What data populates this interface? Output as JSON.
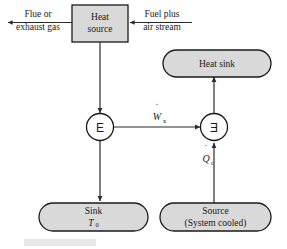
{
  "figure": {
    "type": "exergy-flow-block-diagram",
    "background_color": "#ffffff",
    "node_fill_color": "#d9d9d9",
    "stroke_color": "#1a1a1a",
    "caption_bar_color": "#e8e8e8"
  },
  "nodes": {
    "heat_source": {
      "label_line1": "Heat",
      "label_line2": "source",
      "shape": "rectangle"
    },
    "heat_sink": {
      "label": "Heat sink",
      "shape": "stadium"
    },
    "sink": {
      "label_line1": "Sink",
      "label_line2": "T",
      "label_sub": "0",
      "shape": "stadium"
    },
    "source": {
      "label_line1": "Source",
      "label_line2": "(System cooled)",
      "shape": "stadium"
    },
    "energy_junction": {
      "glyph": "E",
      "shape": "circle"
    },
    "exergy_junction": {
      "glyph": "Ǝ",
      "shape": "circle"
    }
  },
  "streams": {
    "flue_gas": {
      "line1": "Flue or",
      "line2": "exhaust gas",
      "direction": "left"
    },
    "fuel_air": {
      "line1": "Fuel plus",
      "line2": "air stream",
      "direction": "left"
    }
  },
  "flows": {
    "work": {
      "symbol": "W",
      "subscript": "x",
      "accent": "˙",
      "display": "Ẇₓ",
      "direction": "right"
    },
    "heat_cold": {
      "symbol": "Q",
      "subscript": "c",
      "accent": "˙",
      "display": "Q̇ᶜ",
      "direction": "up"
    }
  },
  "connections": [
    {
      "from": "heat_source",
      "to": "energy_junction",
      "direction": "down"
    },
    {
      "from": "energy_junction",
      "to": "exergy_junction",
      "direction": "right",
      "label": "work"
    },
    {
      "from": "energy_junction",
      "to": "sink",
      "direction": "down"
    },
    {
      "from": "source",
      "to": "exergy_junction",
      "direction": "up",
      "label": "heat_cold"
    },
    {
      "from": "exergy_junction",
      "to": "heat_sink",
      "direction": "up"
    }
  ]
}
